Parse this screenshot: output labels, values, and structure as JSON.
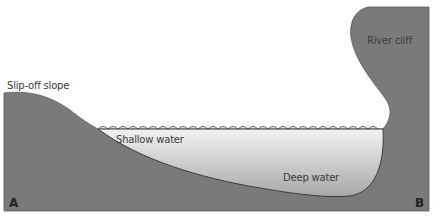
{
  "diagram": {
    "type": "river-meander-cross-section",
    "labels": {
      "slip_off_slope": "Slip-off slope",
      "river_cliff": "River cliff",
      "shallow_water": "Shallow water",
      "deep_water": "Deep water",
      "point_a": "A",
      "point_b": "B"
    },
    "colors": {
      "land": "#7a7a7a",
      "water_top": "#f2f2f2",
      "water_bottom": "#a8a8a8",
      "outline": "#4a4a4a",
      "text": "#3a3a3a"
    }
  }
}
